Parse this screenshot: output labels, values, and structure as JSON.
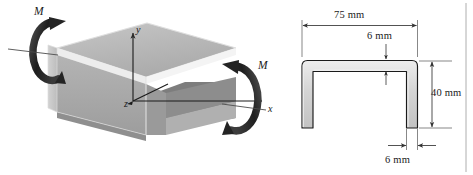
{
  "figure": {
    "background_color": "#ffffff",
    "line_color": "#1a1a1a"
  },
  "left_view": {
    "name": "isometric-beam-view",
    "moment_left": {
      "label": "M",
      "icon": "curved-moment-arrow-icon"
    },
    "moment_right": {
      "label": "M",
      "icon": "curved-moment-arrow-icon"
    },
    "axes": {
      "y_label": "y",
      "x_label": "x",
      "z_label": "z"
    },
    "colors": {
      "top_face": "#b9b9b9",
      "front_face": "#a8a8a8",
      "side_face": "#c9c9c9",
      "inner_dark": "#6e6e6e",
      "edge_light": "#e8e8e8",
      "arrow_dark": "#2b2b2b"
    }
  },
  "right_view": {
    "name": "cross-section-view",
    "dimensions": [
      {
        "id": "width",
        "label": "75 mm",
        "orientation": "horizontal",
        "position": "top"
      },
      {
        "id": "flange-thickness",
        "label": "6 mm",
        "orientation": "vertical",
        "position": "top-inner"
      },
      {
        "id": "height",
        "label": "40 mm",
        "orientation": "vertical",
        "position": "right"
      },
      {
        "id": "web-thickness",
        "label": "6 mm",
        "orientation": "horizontal",
        "position": "bottom"
      }
    ],
    "colors": {
      "fill": "#d6d6d6",
      "fill_light": "#e9e9e9",
      "outline": "#1a1a1a",
      "dim_line": "#4a4a4a"
    }
  }
}
